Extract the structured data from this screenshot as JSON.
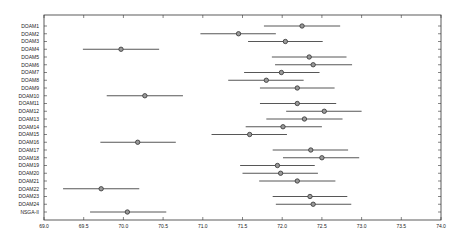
{
  "chart_data": {
    "type": "scatter",
    "subtype": "interval-plot",
    "title": "",
    "xlabel": "",
    "ylabel": "",
    "xlim": [
      69.0,
      74.0
    ],
    "xticks": [
      "69.0",
      "69.5",
      "70.0",
      "70.5",
      "71.0",
      "71.5",
      "72.0",
      "72.5",
      "73.0",
      "73.5",
      "74.0"
    ],
    "grid": false,
    "legend": null,
    "categories": [
      "DOAM1",
      "DOAM2",
      "DOAM3",
      "DOAM4",
      "DOAM5",
      "DOAM6",
      "DOAM7",
      "DOAM8",
      "DOAM9",
      "DOAM10",
      "DOAM11",
      "DOAM12",
      "DOAM13",
      "DOAM14",
      "DOAM15",
      "DOAM16",
      "DOAM17",
      "DOAM18",
      "DOAM19",
      "DOAM20",
      "DOAM21",
      "DOAM22",
      "DOAM23",
      "DOAM24",
      "NSGA-II"
    ],
    "series": [
      {
        "name": "mean",
        "values": [
          72.25,
          71.45,
          72.04,
          69.97,
          72.34,
          72.39,
          71.99,
          71.8,
          72.19,
          70.27,
          72.19,
          72.53,
          72.28,
          72.01,
          71.59,
          70.18,
          72.36,
          72.5,
          71.94,
          71.98,
          72.19,
          69.72,
          72.35,
          72.39,
          70.05
        ]
      },
      {
        "name": "lower",
        "values": [
          71.77,
          70.97,
          71.57,
          69.49,
          71.87,
          71.91,
          71.52,
          71.32,
          71.72,
          69.79,
          71.72,
          72.05,
          71.8,
          71.54,
          71.11,
          69.71,
          71.88,
          72.01,
          71.47,
          71.5,
          71.71,
          69.24,
          71.88,
          71.92,
          69.58
        ]
      },
      {
        "name": "upper",
        "values": [
          72.73,
          71.92,
          72.51,
          70.45,
          72.81,
          72.88,
          72.47,
          72.27,
          72.66,
          70.75,
          72.68,
          73.0,
          72.76,
          72.5,
          72.06,
          70.66,
          72.83,
          72.97,
          72.41,
          72.45,
          72.67,
          70.2,
          72.82,
          72.87,
          70.54
        ]
      }
    ]
  },
  "style": {
    "axis_color": "#333333",
    "line_color": "#444444",
    "marker_edge": "#333333",
    "marker_fill": "#999999"
  }
}
